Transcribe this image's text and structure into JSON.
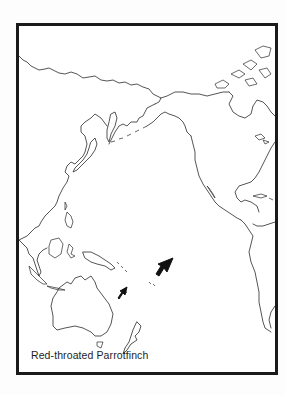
{
  "map": {
    "caption": "Red-throated Parrotfinch",
    "region": "Pacific Ocean basin",
    "projection_extent": "Asia/Australia (west) to the Americas (east)",
    "markers": [
      {
        "name": "large-arrow",
        "points_to": "Fiji / islands east of Vanuatu",
        "size": "large"
      },
      {
        "name": "small-arrow",
        "points_to": "New Caledonia",
        "size": "small"
      }
    ],
    "colors": {
      "frame": "#1a1a1a",
      "coastline": "#2a2a2a",
      "background": "#ffffff"
    }
  }
}
